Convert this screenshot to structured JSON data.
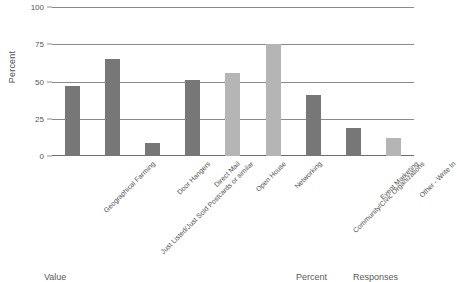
{
  "chart_data": {
    "type": "bar",
    "title": "",
    "xlabel": "",
    "ylabel": "Percent",
    "ylim": [
      0,
      100
    ],
    "yticks": [
      0,
      25,
      50,
      75,
      100
    ],
    "grid": true,
    "legend": false,
    "categories": [
      "Geographical Farming",
      "Just Listed/Just Sold Postcards or similar",
      "Door Hangers",
      "Direct Mail",
      "Open House",
      "Networking",
      "Community/Civic Organizations",
      "Event Marketing",
      "Other - Write In"
    ],
    "values": [
      47,
      65,
      9,
      51,
      56,
      75,
      41,
      19,
      12
    ],
    "bar_colors": [
      "#777777",
      "#777777",
      "#777777",
      "#777777",
      "#b5b5b5",
      "#b5b5b5",
      "#777777",
      "#777777",
      "#b5b5b5"
    ]
  },
  "axis": {
    "y_title": "Percent",
    "y_tick_labels": [
      "100",
      "75",
      "50",
      "25",
      "0"
    ]
  },
  "table_header": {
    "value": "Value",
    "percent": "Percent",
    "responses": "Responses"
  },
  "colors": {
    "bar_dark": "#777777",
    "bar_light": "#b5b5b5",
    "gridline": "#8a8a8a",
    "text": "#4f4f4f",
    "background": "#ffffff"
  }
}
